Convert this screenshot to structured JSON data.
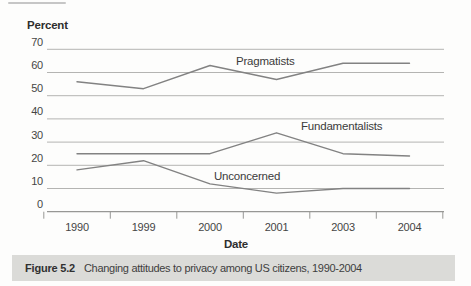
{
  "figure": {
    "y_axis_title": "Percent",
    "x_axis_title": "Date",
    "caption_label": "Figure 5.2",
    "caption_text": "Changing attitudes to privacy among US citizens, 1990-2004"
  },
  "chart_data": {
    "type": "line",
    "title": "Changing attitudes to privacy among US citizens, 1990-2004",
    "xlabel": "Date",
    "ylabel": "Percent",
    "categories": [
      "1990",
      "1999",
      "2000",
      "2001",
      "2003",
      "2004"
    ],
    "series": [
      {
        "name": "Pragmatists",
        "values": [
          56,
          53,
          63,
          57,
          64,
          64
        ]
      },
      {
        "name": "Fundamentalists",
        "values": [
          25,
          25,
          25,
          34,
          25,
          24
        ]
      },
      {
        "name": "Unconcerned",
        "values": [
          18,
          22,
          12,
          8,
          10,
          10
        ]
      }
    ],
    "ylim": [
      0,
      70
    ],
    "yticks": [
      70,
      60,
      50,
      40,
      30,
      20,
      10,
      0
    ],
    "grid": true,
    "legend": "inline-labels",
    "colors": {
      "line": "#828282",
      "grid": "#b4b4b2",
      "axis": "#979795",
      "text": "#454545",
      "caption_bar": "#dbdbd8"
    }
  }
}
